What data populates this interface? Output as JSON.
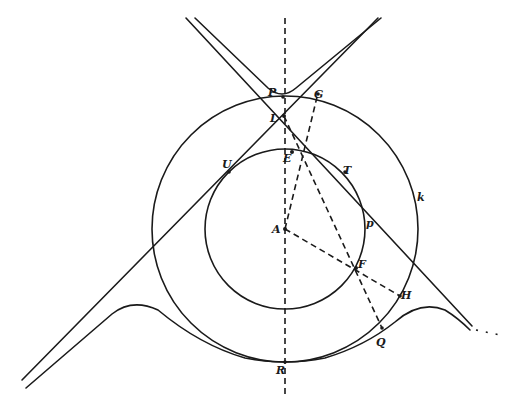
{
  "figure": {
    "stroke_color": "#1a1a1a",
    "background": "#ffffff"
  },
  "points": {
    "A": {
      "label": "A",
      "x": 285,
      "y": 229
    },
    "L": {
      "label": "L",
      "x": 284,
      "y": 116
    },
    "P": {
      "label": "P",
      "x": 280,
      "y": 97
    },
    "G": {
      "label": "G",
      "x": 312,
      "y": 95
    },
    "E": {
      "label": "E",
      "x": 291,
      "y": 155
    },
    "U": {
      "label": "U",
      "x": 228,
      "y": 172
    },
    "T": {
      "label": "T",
      "x": 346,
      "y": 172
    },
    "p": {
      "label": "p",
      "x": 363,
      "y": 220
    },
    "k": {
      "label": "k",
      "x": 419,
      "y": 196
    },
    "F": {
      "label": "F",
      "x": 356,
      "y": 268
    },
    "H": {
      "label": "H",
      "x": 400,
      "y": 296
    },
    "Q": {
      "label": "Q",
      "x": 382,
      "y": 328
    },
    "R": {
      "label": "R",
      "x": 285,
      "y": 362
    }
  },
  "circles": {
    "inner": {
      "cx": 285,
      "cy": 229,
      "r": 80
    },
    "outer": {
      "cx": 285,
      "cy": 229,
      "r": 133
    }
  },
  "labels": {
    "A": "A",
    "L": "L",
    "P": "P",
    "G": "G",
    "E": "E",
    "U": "U",
    "T": "T",
    "p": "p",
    "k": "k",
    "F": "F",
    "H": "H",
    "Q": "Q",
    "R": "R"
  }
}
